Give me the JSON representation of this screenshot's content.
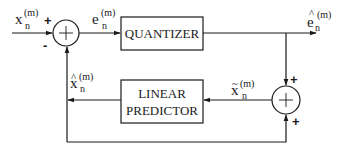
{
  "diagram": {
    "type": "block-diagram",
    "blocks": {
      "quantizer": {
        "label": "QUANTIZER"
      },
      "predictor": {
        "line1": "LINEAR",
        "line2": "PREDICTOR"
      }
    },
    "summing_junctions": {
      "input_sum": {
        "sign_top": "+",
        "sign_bottom": "-"
      },
      "recon_sum": {
        "sign_top": "+",
        "sign_bottom": "+"
      }
    },
    "signals": {
      "input": {
        "base": "x",
        "sub": "n",
        "sup": "(m)",
        "accent": ""
      },
      "error": {
        "base": "e",
        "sub": "n",
        "sup": "(m)",
        "accent": ""
      },
      "q_error": {
        "base": "e",
        "sub": "n",
        "sup": "(m)",
        "accent": "^"
      },
      "prediction": {
        "base": "x",
        "sub": "n",
        "sup": "(m)",
        "accent": "^"
      },
      "recon": {
        "base": "x",
        "sub": "n",
        "sup": "(m)",
        "accent": "~"
      }
    },
    "colors": {
      "stroke": "#1a1a1a",
      "background": "#ffffff"
    }
  }
}
